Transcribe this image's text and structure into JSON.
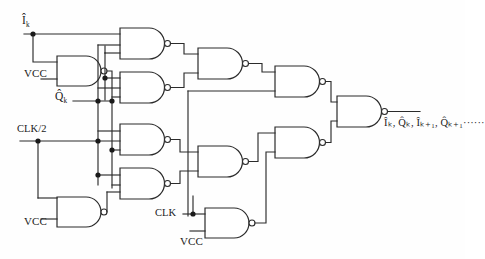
{
  "diagram": {
    "background_color": "#fefefe",
    "line_color": "#2b2b2b"
  },
  "inputs": [
    {
      "id": "i-k",
      "label": "Î",
      "sub": "k",
      "hat": true,
      "x": 22,
      "y": 18
    },
    {
      "id": "vcc-top",
      "label": "VCC",
      "sub": "",
      "hat": false,
      "x": 24,
      "y": 68
    },
    {
      "id": "q-k",
      "label": "Q̂",
      "sub": "k",
      "hat": true,
      "x": 55,
      "y": 93
    },
    {
      "id": "clk2",
      "label": "CLK/2",
      "sub": "",
      "hat": false,
      "x": 17,
      "y": 124
    },
    {
      "id": "vcc-bot",
      "label": "VCC",
      "sub": "",
      "hat": false,
      "x": 24,
      "y": 216
    },
    {
      "id": "clk",
      "label": "CLK",
      "sub": "",
      "hat": false,
      "x": 157,
      "y": 208
    },
    {
      "id": "vcc-clk",
      "label": "VCC",
      "sub": "",
      "hat": false,
      "x": 180,
      "y": 237
    }
  ],
  "output": {
    "id": "out-bus",
    "label": "Î",
    "text": "Îₖ, Q̂ₖ, Îₖ₊₁, Q̂ₖ₊₁······",
    "x": 384,
    "y": 113
  },
  "gates": [
    {
      "id": "nand-1",
      "type": "nand",
      "x": 120,
      "y": 28,
      "w": 46,
      "h": 31,
      "inputs": 2
    },
    {
      "id": "nand-2",
      "type": "nand",
      "x": 57,
      "y": 56,
      "w": 45,
      "h": 30,
      "inputs": 2
    },
    {
      "id": "nand-3",
      "type": "nand",
      "x": 120,
      "y": 72,
      "w": 46,
      "h": 31,
      "inputs": 3
    },
    {
      "id": "nand-4",
      "type": "nand",
      "x": 120,
      "y": 124,
      "w": 46,
      "h": 31,
      "inputs": 3
    },
    {
      "id": "nand-5",
      "type": "nand",
      "x": 120,
      "y": 168,
      "w": 46,
      "h": 31,
      "inputs": 3
    },
    {
      "id": "nand-6",
      "type": "nand",
      "x": 57,
      "y": 197,
      "w": 45,
      "h": 30,
      "inputs": 2
    },
    {
      "id": "nand-7",
      "type": "nand",
      "x": 198,
      "y": 48,
      "w": 46,
      "h": 31,
      "inputs": 2
    },
    {
      "id": "nand-8",
      "type": "nand",
      "x": 198,
      "y": 146,
      "w": 46,
      "h": 31,
      "inputs": 2
    },
    {
      "id": "nand-9",
      "type": "nand",
      "x": 205,
      "y": 208,
      "w": 45,
      "h": 30,
      "inputs": 2
    },
    {
      "id": "nand-10",
      "type": "nand",
      "x": 275,
      "y": 66,
      "w": 46,
      "h": 31,
      "inputs": 2
    },
    {
      "id": "nand-11",
      "type": "nand",
      "x": 275,
      "y": 127,
      "w": 46,
      "h": 31,
      "inputs": 2
    },
    {
      "id": "nand-12",
      "type": "nand",
      "x": 337,
      "y": 96,
      "w": 46,
      "h": 31,
      "inputs": 2
    }
  ],
  "junction_count": 9
}
